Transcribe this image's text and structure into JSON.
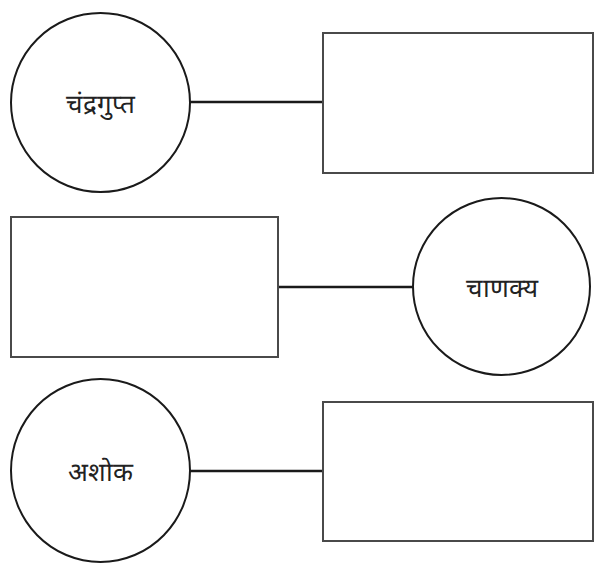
{
  "diagram": {
    "type": "matching-worksheet",
    "rows": [
      {
        "circle_label": "चंद्रगुप्त",
        "circle_side": "left",
        "answer_box": ""
      },
      {
        "circle_label": "चाणक्य",
        "circle_side": "right",
        "answer_box": ""
      },
      {
        "circle_label": "अशोक",
        "circle_side": "left",
        "answer_box": ""
      }
    ]
  }
}
